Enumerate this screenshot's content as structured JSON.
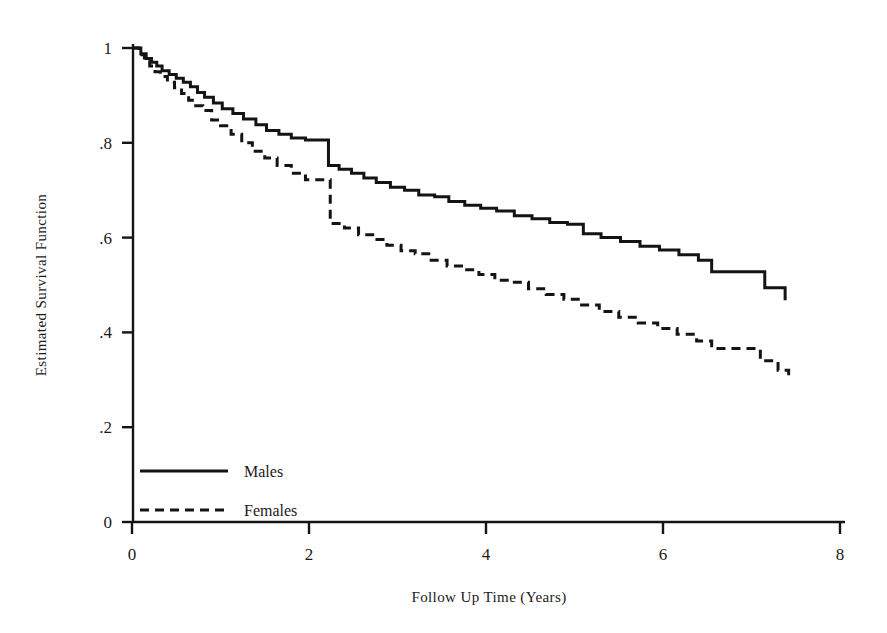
{
  "chart_data": {
    "type": "line",
    "title": "",
    "subtitle": "",
    "xlabel": "Follow Up Time (Years)",
    "ylabel": "Estimated  Survival Function",
    "xlim": [
      0,
      8
    ],
    "ylim": [
      0,
      1
    ],
    "xticks": [
      0,
      2,
      4,
      6,
      8
    ],
    "xtick_labels": [
      "0",
      "2",
      "4",
      "6",
      "8"
    ],
    "yticks": [
      0,
      0.2,
      0.4,
      0.6,
      0.8,
      1
    ],
    "ytick_labels": [
      "0",
      ".2",
      ".4",
      ".6",
      ".8",
      "1"
    ],
    "grid": false,
    "legend_position": "bottom-left",
    "line_color": "#141414",
    "axis_color": "#141414",
    "interpolation": "step-after",
    "series": [
      {
        "name": "Males",
        "style": "solid",
        "x": [
          0.0,
          0.1,
          0.16,
          0.22,
          0.28,
          0.34,
          0.42,
          0.5,
          0.58,
          0.66,
          0.74,
          0.82,
          0.92,
          1.02,
          1.14,
          1.26,
          1.4,
          1.52,
          1.66,
          1.8,
          1.96,
          2.1,
          2.22,
          2.34,
          2.48,
          2.62,
          2.76,
          2.92,
          3.08,
          3.24,
          3.42,
          3.58,
          3.76,
          3.94,
          4.12,
          4.32,
          4.52,
          4.72,
          4.92,
          5.1,
          5.3,
          5.52,
          5.74,
          5.96,
          6.18,
          6.4,
          6.55,
          6.9,
          7.15,
          7.38
        ],
        "y": [
          1.0,
          0.988,
          0.978,
          0.97,
          0.962,
          0.952,
          0.944,
          0.936,
          0.928,
          0.918,
          0.906,
          0.896,
          0.884,
          0.872,
          0.862,
          0.85,
          0.838,
          0.826,
          0.818,
          0.81,
          0.806,
          0.806,
          0.752,
          0.744,
          0.736,
          0.726,
          0.716,
          0.706,
          0.7,
          0.69,
          0.686,
          0.676,
          0.668,
          0.662,
          0.656,
          0.646,
          0.64,
          0.632,
          0.628,
          0.608,
          0.6,
          0.592,
          0.582,
          0.574,
          0.564,
          0.552,
          0.528,
          0.528,
          0.494,
          0.468
        ],
        "end_value": 0.468
      },
      {
        "name": "Females",
        "style": "dashed",
        "x": [
          0.0,
          0.08,
          0.14,
          0.2,
          0.26,
          0.32,
          0.4,
          0.48,
          0.56,
          0.64,
          0.72,
          0.8,
          0.9,
          1.0,
          1.12,
          1.24,
          1.36,
          1.5,
          1.64,
          1.8,
          1.96,
          2.1,
          2.24,
          2.4,
          2.56,
          2.72,
          2.88,
          3.04,
          3.2,
          3.38,
          3.56,
          3.74,
          3.92,
          4.1,
          4.28,
          4.48,
          4.68,
          4.88,
          5.08,
          5.28,
          5.5,
          5.72,
          5.94,
          6.16,
          6.38,
          6.55,
          6.9,
          7.1,
          7.3,
          7.42
        ],
        "y": [
          1.0,
          0.986,
          0.974,
          0.962,
          0.95,
          0.94,
          0.928,
          0.916,
          0.904,
          0.89,
          0.878,
          0.868,
          0.848,
          0.836,
          0.818,
          0.8,
          0.782,
          0.768,
          0.752,
          0.736,
          0.722,
          0.722,
          0.63,
          0.62,
          0.606,
          0.596,
          0.584,
          0.572,
          0.566,
          0.552,
          0.54,
          0.532,
          0.522,
          0.51,
          0.506,
          0.492,
          0.48,
          0.47,
          0.458,
          0.444,
          0.432,
          0.42,
          0.408,
          0.396,
          0.382,
          0.366,
          0.366,
          0.34,
          0.32,
          0.302
        ],
        "end_value": 0.302
      }
    ],
    "legend": [
      {
        "label": "Males",
        "style": "solid"
      },
      {
        "label": "Females",
        "style": "dashed"
      }
    ]
  }
}
